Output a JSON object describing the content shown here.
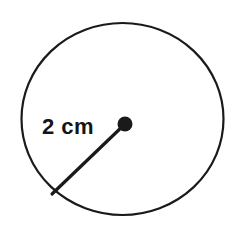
{
  "figure": {
    "kind": "geometry-diagram",
    "background_color": "#ffffff",
    "stroke_color": "#1a1a1a"
  },
  "circle": {
    "name": "circle-outline",
    "center_x": 122.5,
    "center_y": 119,
    "radius_x": 101,
    "radius_y": 96,
    "stroke_width": 2.2,
    "fill": "none"
  },
  "center_point": {
    "name": "center-dot",
    "x": 125,
    "y": 124,
    "radius": 7.5,
    "fill": "#1a1a1a"
  },
  "radius_segment": {
    "name": "radius-line",
    "x1": 125,
    "y1": 124,
    "x2": 52,
    "y2": 194,
    "stroke_width": 3.2,
    "stroke_color": "#1a1a1a"
  },
  "radius_label": {
    "text": "2 cm",
    "x": 42,
    "y": 134,
    "font_size": 22,
    "font_weight": "bold",
    "color": "#151515"
  }
}
